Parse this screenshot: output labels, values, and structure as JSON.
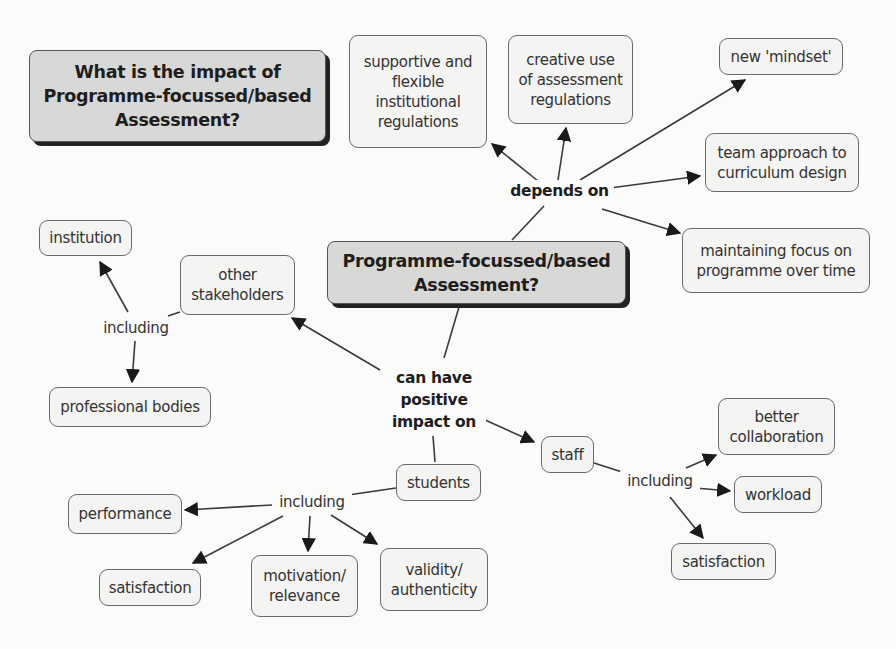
{
  "diagram": {
    "type": "concept-map",
    "title": "What is the impact of\nProgramme-focussed/based\nAssessment?",
    "central_concept": "Programme-focussed/based\nAssessment?",
    "nodes": {
      "supportive": "supportive and\nflexible\ninstitutional\nregulations",
      "creative": "creative use\nof assessment\nregulations",
      "mindset": "new 'mindset'",
      "team": "team approach to\ncurriculum design",
      "maintaining": "maintaining focus on\nprogramme over time",
      "institution": "institution",
      "other_stakeholders": "other\nstakeholders",
      "professional_bodies": "professional bodies",
      "staff": "staff",
      "better_collaboration": "better\ncollaboration",
      "workload": "workload",
      "staff_satisfaction": "satisfaction",
      "students": "students",
      "performance": "performance",
      "student_satisfaction": "satisfaction",
      "motivation": "motivation/\nrelevance",
      "validity": "validity/\nauthenticity"
    },
    "link_labels": {
      "depends_on": "depends on",
      "can_have": "can have\npositive\nimpact on",
      "including_stakeholders": "including",
      "including_staff": "including",
      "including_students": "including"
    },
    "relations": [
      {
        "from": "central_concept",
        "label": "depends on",
        "to": [
          "supportive",
          "creative",
          "mindset",
          "team",
          "maintaining"
        ]
      },
      {
        "from": "central_concept",
        "label": "can have positive impact on",
        "to": [
          "other_stakeholders",
          "staff",
          "students"
        ]
      },
      {
        "from": "other_stakeholders",
        "label": "including",
        "to": [
          "institution",
          "professional_bodies"
        ]
      },
      {
        "from": "staff",
        "label": "including",
        "to": [
          "better_collaboration",
          "workload",
          "staff_satisfaction"
        ]
      },
      {
        "from": "students",
        "label": "including",
        "to": [
          "performance",
          "student_satisfaction",
          "motivation",
          "validity"
        ]
      }
    ],
    "colors": {
      "background": "#fbfbfa",
      "node_fill": "#f4f4f2",
      "main_node_fill": "#d8d8d6",
      "border": "#6a6a6a",
      "shadow": "#222222",
      "line": "#3a3a3a"
    }
  }
}
